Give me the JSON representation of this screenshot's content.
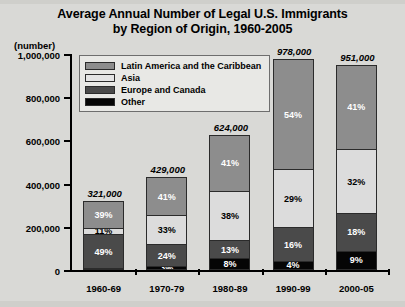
{
  "title": {
    "line1": "Average Annual Number of Legal U.S. Immigrants",
    "line2": "by Region of Origin, 1960-2005"
  },
  "axis": {
    "unit_label": "(number)",
    "y_ticks": [
      "1,000,000",
      "800,000",
      "600,000",
      "400,000",
      "200,000",
      "0"
    ]
  },
  "legend": {
    "items": [
      {
        "label": "Latin America and the Caribbean",
        "color": "#8d8d8d"
      },
      {
        "label": "Asia",
        "color": "#e4e4e4"
      },
      {
        "label": "Europe and Canada",
        "color": "#4a4a4a"
      },
      {
        "label": "Other",
        "color": "#050505"
      }
    ]
  },
  "chart_data": {
    "type": "bar",
    "subtype": "stacked-percentage-with-totals",
    "title": "Average Annual Number of Legal U.S. Immigrants by Region of Origin, 1960-2005",
    "xlabel": "",
    "ylabel": "(number)",
    "ylim": [
      0,
      1000000
    ],
    "ytick_values": [
      0,
      200000,
      400000,
      600000,
      800000,
      1000000
    ],
    "grid": false,
    "legend_position": "top-left-inside",
    "categories": [
      "1960-69",
      "1970-79",
      "1980-89",
      "1990-99",
      "2000-05"
    ],
    "totals": [
      321000,
      429000,
      624000,
      978000,
      951000
    ],
    "total_labels": [
      "321,000",
      "429,000",
      "624,000",
      "978,000",
      "951,000"
    ],
    "series": [
      {
        "name": "Latin America and the Caribbean",
        "color": "#8d8d8d",
        "values": [
          39,
          41,
          41,
          54,
          41
        ],
        "labels": [
          "39%",
          "41%",
          "41%",
          "54%",
          "41%"
        ]
      },
      {
        "name": "Asia",
        "color": "#e4e4e4",
        "values": [
          11,
          33,
          38,
          29,
          32
        ],
        "labels": [
          "11%",
          "33%",
          "38%",
          "29%",
          "32%"
        ]
      },
      {
        "name": "Europe and Canada",
        "color": "#4a4a4a",
        "values": [
          49,
          24,
          13,
          16,
          18
        ],
        "labels": [
          "49%",
          "24%",
          "13%",
          "16%",
          "18%"
        ]
      },
      {
        "name": "Other",
        "color": "#050505",
        "values": [
          1,
          3,
          8,
          4,
          9
        ],
        "labels": [
          "1%",
          "3%",
          "8%",
          "4%",
          "9%"
        ]
      }
    ]
  }
}
